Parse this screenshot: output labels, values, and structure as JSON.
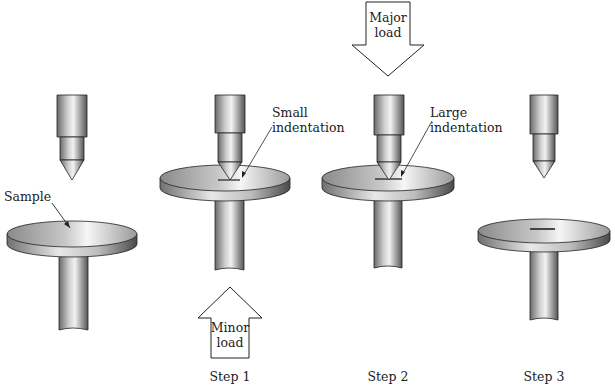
{
  "figure": {
    "labels": {
      "sample": "Sample",
      "small_indentation_1": "Small",
      "small_indentation_2": "indentation",
      "large_indentation_1": "Large",
      "large_indentation_2": "indentation",
      "minor_load_1": "Minor",
      "minor_load_2": "load",
      "major_load_1": "Major",
      "major_load_2": "load"
    },
    "steps": [
      {
        "label": ""
      },
      {
        "label": "Step 1"
      },
      {
        "label": "Step 2"
      },
      {
        "label": "Step 3"
      }
    ],
    "colors": {
      "metal_light": "#f4f4f4",
      "metal_mid": "#b8b8b8",
      "metal_dark": "#555555",
      "outline": "#222222"
    }
  }
}
